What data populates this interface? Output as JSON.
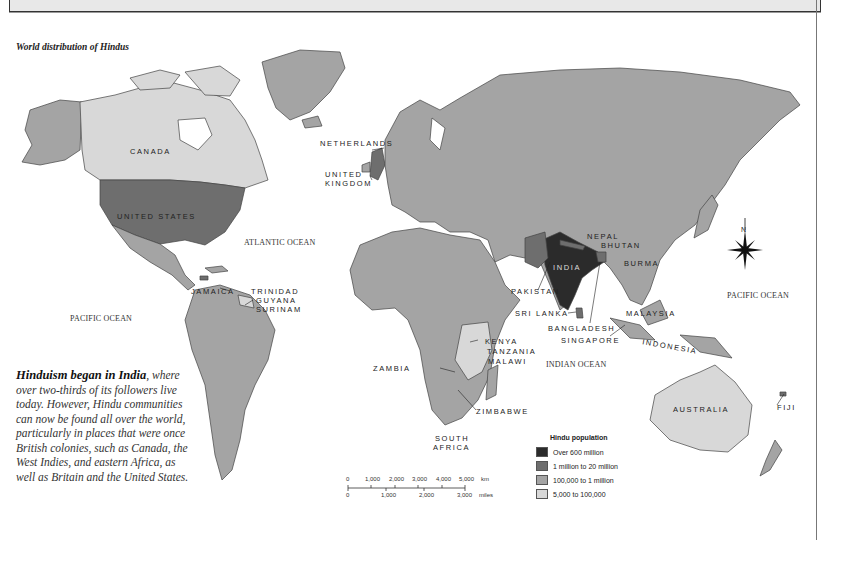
{
  "map": {
    "title": "World distribution of Hindus",
    "oceans": {
      "atlantic": "ATLANTIC OCEAN",
      "pacific_west": "PACIFIC OCEAN",
      "pacific_east": "PACIFIC OCEAN",
      "indian": "INDIAN OCEAN"
    },
    "countries": {
      "canada": "CANADA",
      "united_states": "UNITED STATES",
      "netherlands": "NETHERLANDS",
      "united_kingdom_1": "UNITED",
      "united_kingdom_2": "KINGDOM",
      "jamaica": "JAMAICA",
      "trinidad": "TRINIDAD",
      "guyana": "GUYANA",
      "surinam": "SURINAM",
      "india": "INDIA",
      "nepal": "NEPAL",
      "bhutan": "BHUTAN",
      "burma": "BURMA",
      "pakistan": "PAKISTAN",
      "sri_lanka": "SRI LANKA",
      "bangladesh": "BANGLADESH",
      "singapore": "SINGAPORE",
      "malaysia": "MALAYSIA",
      "indonesia": "INDONESIA",
      "australia": "AUSTRALIA",
      "fiji": "FIJI",
      "kenya": "KENYA",
      "tanzania": "TANZANIA",
      "malawi": "MALAWI",
      "zambia": "ZAMBIA",
      "zimbabwe": "ZIMBABWE",
      "south_africa_1": "SOUTH",
      "south_africa_2": "AFRICA"
    },
    "compass": "N"
  },
  "caption": {
    "lead": "Hinduism began in India",
    "body": ", where over two-thirds of its followers live today. However, Hindu communities can now be found all over the world, particularly in places that were once British colonies, such as Canada, the West Indies, and eastern Africa, as well as Britain and the United States."
  },
  "legend": {
    "title": "Hindu population",
    "items": [
      {
        "label": "Over 600 million",
        "color": "#2b2b2b"
      },
      {
        "label": "1 million to 20 million",
        "color": "#6e6e6e"
      },
      {
        "label": "100,000 to 1 million",
        "color": "#a4a4a4"
      },
      {
        "label": "5,000 to 100,000",
        "color": "#d8d8d8"
      }
    ]
  },
  "scale": {
    "km_ticks": [
      "0",
      "1,000",
      "2,000",
      "3,000",
      "4,000",
      "5,000"
    ],
    "km_unit": "km",
    "mile_ticks": [
      "0",
      "1,000",
      "2,000",
      "3,000"
    ],
    "mile_unit": "miles"
  }
}
